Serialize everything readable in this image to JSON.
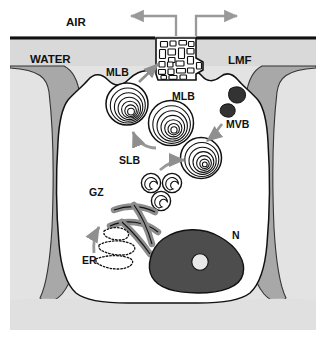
{
  "figure": {
    "labels": {
      "air": "AIR",
      "water": "WATER",
      "lmf": "LMF",
      "mlb_upper": "MLB",
      "mlb_center": "MLB",
      "mvb": "MVB",
      "slb": "SLB",
      "gz": "GZ",
      "er": "ER",
      "n": "N"
    },
    "colors": {
      "air_background": "#ffffff",
      "water_layer": "#d9d9d9",
      "surface_line": "#111111",
      "cell_cytoplasm": "#ffffff",
      "neighbor_cell": "#a8a8a8",
      "basal_layer": "#e0e0e0",
      "nucleus": "#4d4d4d",
      "nucleolus": "#e8e8e8",
      "mvb_body": "#333333",
      "golgi": "#8c8c8c",
      "arrow_gray": "#999999",
      "outline": "#111111",
      "text": "#111111"
    },
    "structures": [
      {
        "name": "tubular-myelin",
        "label": "LMF",
        "description": "lattice of rectangular tubular myelin profiles at the air-water interface"
      },
      {
        "name": "multilamellar-body-secreting",
        "label": "MLB",
        "description": "multilamellar body fusing with apical membrane"
      },
      {
        "name": "multilamellar-body-cytoplasmic",
        "label": "MLB",
        "description": "mature multilamellar body in cytoplasm"
      },
      {
        "name": "multivesicular-body",
        "label": "MVB",
        "description": "two dark multivesicular bodies"
      },
      {
        "name": "small-lamellar-body",
        "label": "SLB",
        "description": "three small lamellar bodies"
      },
      {
        "name": "golgi-zone",
        "label": "GZ",
        "description": "stacked Golgi cisternae ribbons"
      },
      {
        "name": "endoplasmic-reticulum",
        "label": "ER",
        "description": "rough endoplasmic reticulum loops with ribosomes"
      },
      {
        "name": "nucleus",
        "label": "N",
        "description": "nucleus with central nucleolus"
      }
    ],
    "arrows": [
      {
        "name": "air-flow-left",
        "direction": "left",
        "description": "surfactant film spreading left along the air-water interface"
      },
      {
        "name": "air-flow-right",
        "direction": "right",
        "description": "surfactant film spreading right along the air-water interface"
      },
      {
        "name": "exocytosis-arrow",
        "direction": "up-right",
        "description": "MLB secretion toward tubular myelin"
      },
      {
        "name": "mlb-to-apex-arrow",
        "direction": "up-left",
        "description": "MLB transport toward apical membrane"
      },
      {
        "name": "mvb-to-mlb-arrow",
        "direction": "down-left",
        "description": "MVB maturing into MLB"
      },
      {
        "name": "slb-to-mlb-arrow",
        "direction": "right",
        "description": "SLB maturing into MLB"
      },
      {
        "name": "er-to-golgi-arrow",
        "direction": "up",
        "description": "transport from ER to Golgi zone"
      }
    ]
  }
}
